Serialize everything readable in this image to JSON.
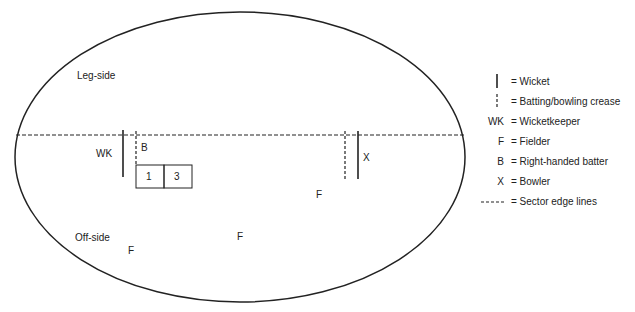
{
  "diagram": {
    "regions": {
      "leg_side": "Leg-side",
      "off_side": "Off-side"
    },
    "players": {
      "wicketkeeper": "WK",
      "batter": "B",
      "bowler": "X",
      "fielders": [
        "F",
        "F",
        "F"
      ]
    },
    "sectors": [
      "1",
      "3"
    ]
  },
  "legend": {
    "items": [
      {
        "symbol": "wicket",
        "text": "= Wicket"
      },
      {
        "symbol": "crease",
        "text": "= Batting/bowling crease"
      },
      {
        "symbol": "WK",
        "text": "= Wicketkeeper"
      },
      {
        "symbol": "F",
        "text": "= Fielder"
      },
      {
        "symbol": "B",
        "text": "= Right-handed batter"
      },
      {
        "symbol": "X",
        "text": "= Bowler"
      },
      {
        "symbol": "----",
        "text": "= Sector edge lines"
      }
    ]
  }
}
